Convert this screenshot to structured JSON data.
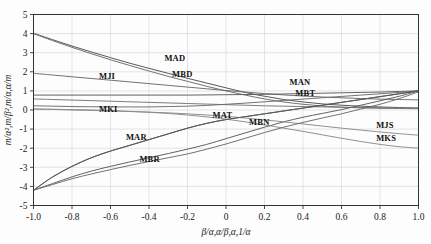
{
  "chart_data": {
    "type": "line",
    "title": "",
    "subtitle": "",
    "xlabel": "β/α,α/β,α,1/α",
    "ylabel": "m/α²,m/β²,m/α,α/m",
    "xlim": [
      -1.0,
      1.0
    ],
    "ylim": [
      -5,
      5
    ],
    "grid": true,
    "legend_position": "inline-labels",
    "xticks": [
      -1.0,
      -0.8,
      -0.6,
      -0.4,
      -0.2,
      0,
      0.2,
      0.4,
      0.6,
      0.8,
      1.0
    ],
    "xticklabels": [
      "-1.0",
      "-0.8",
      "-0.6",
      "-0.4",
      "-0.2",
      "0",
      "0.2",
      "0.4",
      "0.6",
      "0.8",
      "1.0"
    ],
    "yticks": [
      -5,
      -4,
      -3,
      -2,
      -1,
      0,
      1,
      2,
      3,
      4,
      5
    ],
    "yticklabels": [
      "-5",
      "-4",
      "-3",
      "-2",
      "-1",
      "0",
      "1",
      "2",
      "3",
      "4",
      "5"
    ],
    "x": [
      -1.0,
      -0.9,
      -0.8,
      -0.7,
      -0.6,
      -0.5,
      -0.4,
      -0.3,
      -0.2,
      -0.1,
      0.0,
      0.1,
      0.2,
      0.3,
      0.4,
      0.5,
      0.6,
      0.7,
      0.8,
      0.9,
      1.0
    ],
    "series": [
      {
        "name": "MAD",
        "label": "MAD",
        "label_x": -0.32,
        "label_y": 2.55,
        "color": "#4f4f4f",
        "values": [
          4.02,
          3.68,
          3.35,
          3.04,
          2.74,
          2.45,
          2.18,
          1.92,
          1.66,
          1.41,
          1.16,
          0.92,
          0.72,
          0.55,
          0.42,
          0.32,
          0.25,
          0.2,
          0.16,
          0.13,
          0.1
        ]
      },
      {
        "name": "MBD",
        "label": "MBD",
        "label_x": -0.28,
        "label_y": 1.72,
        "color": "#6a6a6a",
        "values": [
          4.0,
          3.63,
          3.28,
          2.95,
          2.63,
          2.33,
          2.04,
          1.76,
          1.5,
          1.24,
          1.0,
          0.78,
          0.58,
          0.42,
          0.3,
          0.21,
          0.15,
          0.11,
          0.09,
          0.08,
          0.07
        ]
      },
      {
        "name": "MJI",
        "label": "MJI",
        "label_x": -0.66,
        "label_y": 1.62,
        "color": "#6a6a6a",
        "values": [
          1.92,
          1.83,
          1.74,
          1.65,
          1.56,
          1.47,
          1.38,
          1.29,
          1.2,
          1.11,
          1.02,
          0.94,
          0.86,
          0.79,
          0.73,
          0.68,
          0.64,
          0.6,
          0.57,
          0.55,
          0.53
        ]
      },
      {
        "name": "MKI",
        "label": "MKI",
        "label_x": -0.66,
        "label_y": -0.12,
        "color": "#757575",
        "values": [
          0.58,
          0.55,
          0.52,
          0.49,
          0.46,
          0.43,
          0.4,
          0.37,
          0.34,
          0.31,
          0.28,
          0.25,
          0.22,
          0.2,
          0.18,
          0.16,
          0.14,
          0.13,
          0.12,
          0.11,
          0.1
        ]
      },
      {
        "name": "MAN",
        "label": "MAN",
        "label_x": 0.33,
        "label_y": 1.32,
        "color": "#5a5a5a",
        "values": [
          0.78,
          0.78,
          0.78,
          0.78,
          0.78,
          0.78,
          0.78,
          0.78,
          0.78,
          0.79,
          0.8,
          0.81,
          0.82,
          0.84,
          0.86,
          0.88,
          0.9,
          0.92,
          0.94,
          0.97,
          1.0
        ]
      },
      {
        "name": "MBT",
        "label": "MBT",
        "label_x": 0.36,
        "label_y": 0.72,
        "color": "#6a6a6a",
        "values": [
          0.22,
          0.2,
          0.18,
          0.17,
          0.16,
          0.16,
          0.16,
          0.18,
          0.2,
          0.24,
          0.3,
          0.36,
          0.43,
          0.5,
          0.57,
          0.64,
          0.71,
          0.78,
          0.85,
          0.92,
          1.0
        ]
      },
      {
        "name": "MAT",
        "label": "MAT",
        "label_x": -0.07,
        "label_y": -0.42,
        "color": "#4a4a4a",
        "values": [
          -4.2,
          -3.5,
          -2.95,
          -2.5,
          -2.15,
          -1.85,
          -1.55,
          -1.25,
          -0.95,
          -0.7,
          -0.5,
          -0.35,
          -0.2,
          -0.05,
          0.1,
          0.25,
          0.4,
          0.55,
          0.7,
          0.85,
          1.0
        ]
      },
      {
        "name": "MBN",
        "label": "MBN",
        "label_x": 0.12,
        "label_y": -0.78,
        "color": "#5a5a5a",
        "values": [
          -4.2,
          -3.85,
          -3.5,
          -3.2,
          -2.95,
          -2.72,
          -2.5,
          -2.28,
          -2.05,
          -1.8,
          -1.5,
          -1.2,
          -0.9,
          -0.62,
          -0.38,
          -0.18,
          0.02,
          0.25,
          0.48,
          0.72,
          1.0
        ]
      },
      {
        "name": "MJS",
        "label": "MJS",
        "label_x": 0.78,
        "label_y": -0.95,
        "color": "#8a8a8a",
        "values": [
          0.05,
          0.03,
          0.0,
          -0.02,
          -0.05,
          -0.08,
          -0.11,
          -0.15,
          -0.2,
          -0.26,
          -0.33,
          -0.42,
          -0.52,
          -0.62,
          -0.73,
          -0.84,
          -0.95,
          -1.05,
          -1.15,
          -1.24,
          -1.32
        ]
      },
      {
        "name": "MKS",
        "label": "MKS",
        "label_x": 0.78,
        "label_y": -1.62,
        "color": "#8a8a8a",
        "values": [
          0.05,
          0.04,
          0.02,
          0.0,
          -0.03,
          -0.07,
          -0.12,
          -0.18,
          -0.26,
          -0.36,
          -0.48,
          -0.62,
          -0.78,
          -0.95,
          -1.12,
          -1.3,
          -1.48,
          -1.65,
          -1.8,
          -1.92,
          -2.0
        ]
      },
      {
        "name": "MAR",
        "label": "MAR",
        "label_x": -0.52,
        "label_y": -1.55,
        "color": "#5a5a5a",
        "values": [
          -4.2,
          -3.5,
          -2.95,
          -2.5,
          -2.15,
          -1.85,
          -1.55,
          -1.25,
          -0.95,
          -0.7,
          -0.5,
          -0.35,
          -0.2,
          -0.05,
          0.1,
          0.25,
          0.4,
          0.55,
          0.7,
          0.85,
          1.0
        ]
      },
      {
        "name": "MBR",
        "label": "MBR",
        "label_x": -0.45,
        "label_y": -2.72,
        "color": "#6a6a6a",
        "values": [
          -4.2,
          -3.9,
          -3.6,
          -3.35,
          -3.12,
          -2.9,
          -2.7,
          -2.5,
          -2.3,
          -2.05,
          -1.78,
          -1.48,
          -1.18,
          -0.9,
          -0.65,
          -0.42,
          -0.2,
          0.05,
          0.3,
          0.6,
          0.95
        ]
      }
    ]
  },
  "figure": {
    "background_color": "#fdfdfd",
    "frame_color": "#333333",
    "grid_color": "#d9d9d9",
    "text_color": "#1a1a1a"
  }
}
